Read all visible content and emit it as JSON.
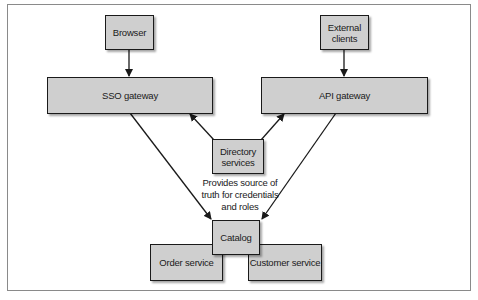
{
  "diagram": {
    "nodes": {
      "browser": {
        "label": "Browser"
      },
      "external_clients": {
        "label": "External\nclients"
      },
      "sso_gateway": {
        "label": "SSO gateway"
      },
      "api_gateway": {
        "label": "API gateway"
      },
      "directory_services": {
        "label": "Directory\nservices"
      },
      "catalog": {
        "label": "Catalog"
      },
      "order_service": {
        "label": "Order service"
      },
      "customer_service": {
        "label": "Customer service"
      }
    },
    "annotation": "Provides source of\ntruth for credentials\nand roles",
    "edges": [
      {
        "from": "Browser",
        "to": "SSO gateway"
      },
      {
        "from": "External clients",
        "to": "API gateway"
      },
      {
        "from": "Directory services",
        "to": "SSO gateway"
      },
      {
        "from": "Directory services",
        "to": "API gateway"
      },
      {
        "from": "SSO gateway",
        "to": "Catalog"
      },
      {
        "from": "API gateway",
        "to": "Catalog"
      }
    ],
    "colors": {
      "node_fill": "#cfcfcf",
      "border": "#1a1a1a",
      "frame": "#8a8a8a"
    }
  }
}
